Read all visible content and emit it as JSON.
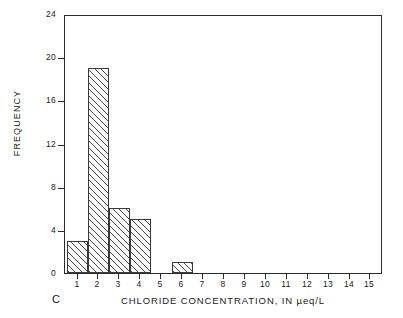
{
  "chart_data": {
    "type": "bar",
    "title": "",
    "subtitle": "",
    "panel_label": "C",
    "xlabel": "CHLORIDE CONCENTRATION, IN µeq/L",
    "ylabel": "FREQUENCY",
    "categories": [
      1,
      2,
      3,
      4,
      5,
      6,
      7,
      8,
      9,
      10,
      11,
      12,
      13,
      14,
      15
    ],
    "values": [
      3,
      19,
      6,
      5,
      0,
      1,
      0,
      0,
      0,
      0,
      0,
      0,
      0,
      0,
      0
    ],
    "xtick_labels": [
      "1",
      "2",
      "3",
      "4",
      "5",
      "6",
      "7",
      "8",
      "9",
      "10",
      "11",
      "12",
      "13",
      "14",
      "15"
    ],
    "ytick_labels": [
      "0",
      "4",
      "8",
      "12",
      "16",
      "20",
      "24"
    ],
    "ytick_values": [
      0,
      4,
      8,
      12,
      16,
      20,
      24
    ],
    "xlim": [
      0.4,
      15.6
    ],
    "ylim": [
      0,
      24
    ],
    "grid": false,
    "legend": false,
    "bar_fill": "hatched-diagonal",
    "bar_edge_color": "#3a3a3a",
    "axis_color": "#2b2b2b",
    "background": "#ffffff"
  }
}
